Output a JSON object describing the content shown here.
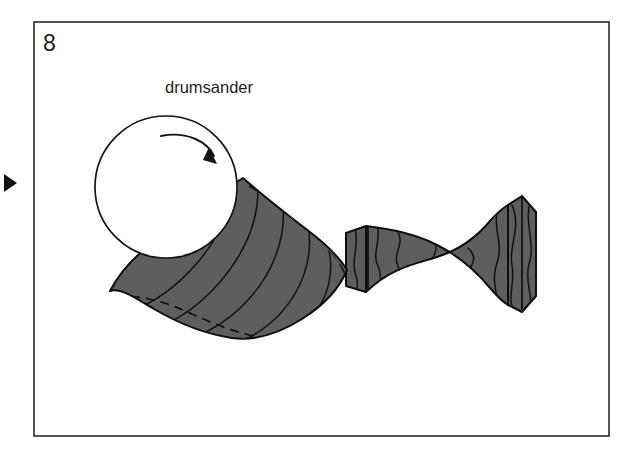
{
  "figure": {
    "number": "8",
    "caption_label": "drumsander",
    "panel_marker_icon": "play-triangle-marker-icon"
  },
  "colors": {
    "wood_fill": "#5e5e5e",
    "outline": "#0e0e0e",
    "frame_stroke": "#2b2b2b",
    "background": "#ffffff",
    "text": "#1a1a1a"
  },
  "drumsander": {
    "icon": "sanding-drum-circle-icon",
    "center_x": 166,
    "center_y": 187,
    "radius": 71,
    "rotation_arrow_icon": "clockwise-rotation-arrow-icon",
    "rotation_direction": "clockwise"
  },
  "workpiece": {
    "name": "turned-spindle-blank",
    "description": "Shaded turned wooden spindle with crescent-shaped flared end being sanded",
    "segments": [
      {
        "name": "flared-crescent-head",
        "has_hidden_dashed_contour": true
      },
      {
        "name": "narrow-neck-collar",
        "has_hidden_dashed_contour": true
      },
      {
        "name": "tapered-waist-shaft",
        "has_hidden_dashed_contour": false
      },
      {
        "name": "faceted-end-block",
        "has_hidden_dashed_contour": false
      }
    ]
  },
  "frame": {
    "name": "illustration-border",
    "x": 34,
    "y": 22,
    "width": 575,
    "height": 414
  }
}
